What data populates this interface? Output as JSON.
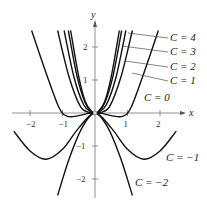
{
  "chart_data": {
    "type": "line",
    "title": "",
    "xlabel": "x",
    "ylabel": "y",
    "xlim": [
      -2.5,
      2.6
    ],
    "ylim": [
      -2.5,
      2.5
    ],
    "x_ticks": [
      "-2",
      "-1",
      "1",
      "2"
    ],
    "y_ticks": [
      "2",
      "1",
      "-1",
      "-2"
    ],
    "grid": false,
    "legend": "leader-line labels on right",
    "series": [
      {
        "name": "C = 4",
        "points": [
          [
            -0.75,
            2.5
          ],
          [
            -0.5,
            1.1
          ],
          [
            -0.3,
            0.35
          ],
          [
            -0.1,
            0.04
          ],
          [
            0,
            0
          ],
          [
            0.1,
            0.04
          ],
          [
            0.3,
            0.35
          ],
          [
            0.5,
            1.1
          ],
          [
            0.75,
            2.5
          ]
        ]
      },
      {
        "name": "C = 3",
        "points": [
          [
            -0.82,
            2.5
          ],
          [
            -0.55,
            1.1
          ],
          [
            -0.3,
            0.3
          ],
          [
            -0.1,
            0.03
          ],
          [
            0,
            0
          ],
          [
            0.1,
            0.03
          ],
          [
            0.3,
            0.3
          ],
          [
            0.55,
            1.1
          ],
          [
            0.82,
            2.5
          ]
        ]
      },
      {
        "name": "C = 2",
        "points": [
          [
            -0.95,
            2.5
          ],
          [
            -0.65,
            1.1
          ],
          [
            -0.35,
            0.25
          ],
          [
            -0.1,
            0.02
          ],
          [
            0,
            0
          ],
          [
            0.1,
            0.02
          ],
          [
            0.35,
            0.25
          ],
          [
            0.65,
            1.1
          ],
          [
            0.95,
            2.5
          ]
        ]
      },
      {
        "name": "C = 1",
        "points": [
          [
            -1.15,
            2.5
          ],
          [
            -0.8,
            1.1
          ],
          [
            -0.45,
            0.2
          ],
          [
            -0.15,
            0.01
          ],
          [
            0,
            0
          ],
          [
            0.15,
            0.01
          ],
          [
            0.45,
            0.2
          ],
          [
            0.8,
            1.1
          ],
          [
            1.15,
            2.5
          ]
        ]
      },
      {
        "name": "C = 0",
        "points": [
          [
            -1.95,
            2.5
          ],
          [
            -1.5,
            1.2
          ],
          [
            -1.1,
            0.15
          ],
          [
            -0.85,
            -0.1
          ],
          [
            -0.5,
            -0.08
          ],
          [
            -0.2,
            -0.01
          ],
          [
            0,
            0
          ],
          [
            0.2,
            -0.01
          ],
          [
            0.5,
            -0.08
          ],
          [
            0.85,
            -0.1
          ],
          [
            1.1,
            0.15
          ],
          [
            1.5,
            1.2
          ],
          [
            1.95,
            2.5
          ]
        ]
      },
      {
        "name": "C = -1",
        "points": [
          [
            -2.5,
            -0.55
          ],
          [
            -2.0,
            -1.15
          ],
          [
            -1.5,
            -1.4
          ],
          [
            -1.0,
            -1.1
          ],
          [
            -0.5,
            -0.45
          ],
          [
            0,
            0
          ],
          [
            0.5,
            -0.45
          ],
          [
            1.0,
            -1.1
          ],
          [
            1.5,
            -1.4
          ],
          [
            2.0,
            -1.15
          ],
          [
            2.5,
            -0.55
          ]
        ]
      },
      {
        "name": "C = -2",
        "points": [
          [
            -1.15,
            -2.5
          ],
          [
            -0.8,
            -1.4
          ],
          [
            -0.4,
            -0.45
          ],
          [
            0,
            0
          ],
          [
            0.4,
            -0.45
          ],
          [
            0.8,
            -1.4
          ],
          [
            1.15,
            -2.5
          ]
        ]
      }
    ],
    "labels": [
      {
        "text": "C = 4",
        "x": 2.5,
        "y": 2.3
      },
      {
        "text": "C = 3",
        "x": 2.5,
        "y": 1.9
      },
      {
        "text": "C = 2",
        "x": 2.5,
        "y": 1.4
      },
      {
        "text": "C = 1",
        "x": 2.5,
        "y": 1.0
      },
      {
        "text": "C = 0",
        "x": 1.6,
        "y": 0.45
      },
      {
        "text": "C = −1",
        "x": 2.3,
        "y": -1.3
      },
      {
        "text": "C = −2",
        "x": 1.3,
        "y": -2.2
      }
    ]
  },
  "axes": {
    "x_label": "x",
    "y_label": "y"
  }
}
